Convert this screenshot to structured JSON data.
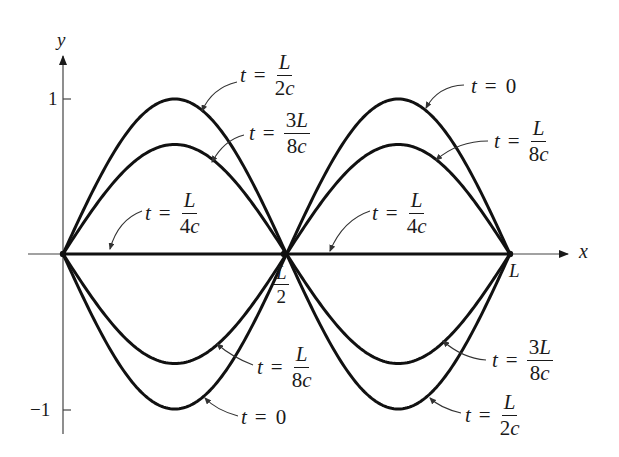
{
  "figure": {
    "axes": {
      "x_label": "x",
      "y_label": "y",
      "y_ticks": [
        {
          "value": 1,
          "label": "1"
        },
        {
          "value": -1,
          "label": "−1"
        }
      ],
      "x_marks": [
        {
          "value": "L/2",
          "num": "L",
          "den": "2"
        },
        {
          "value": "L",
          "label": "L"
        }
      ]
    },
    "curves": [
      {
        "time": "t = 0",
        "amplitude": 1,
        "shape": "sin(2πx/L)"
      },
      {
        "time": "t = L/8c",
        "amplitude": 0.707,
        "shape": "sin(2πx/L)"
      },
      {
        "time": "t = L/4c",
        "amplitude": 0,
        "shape": "flat"
      },
      {
        "time": "t = 3L/8c",
        "amplitude": -0.707,
        "shape": "sin(2πx/L)"
      },
      {
        "time": "t = L/2c",
        "amplitude": -1,
        "shape": "sin(2πx/L)"
      }
    ],
    "labels": {
      "top_left_outer": {
        "t": "t",
        "eq": "=",
        "num": "L",
        "den": "2c"
      },
      "top_left_inner": {
        "t": "t",
        "eq": "=",
        "num": "3L",
        "den": "8c"
      },
      "mid_left": {
        "t": "t",
        "eq": "=",
        "num": "L",
        "den": "4c"
      },
      "top_right_outer": {
        "t": "t",
        "eq": "=",
        "value": "0"
      },
      "top_right_inner": {
        "t": "t",
        "eq": "=",
        "num": "L",
        "den": "8c"
      },
      "mid_right": {
        "t": "t",
        "eq": "=",
        "num": "L",
        "den": "4c"
      },
      "bottom_left_inner": {
        "t": "t",
        "eq": "=",
        "num": "L",
        "den": "8c"
      },
      "bottom_left_outer": {
        "t": "t",
        "eq": "=",
        "value": "0"
      },
      "bottom_right_inner": {
        "t": "t",
        "eq": "=",
        "num": "3L",
        "den": "8c"
      },
      "bottom_right_outer": {
        "t": "t",
        "eq": "=",
        "num": "L",
        "den": "2c"
      }
    }
  }
}
